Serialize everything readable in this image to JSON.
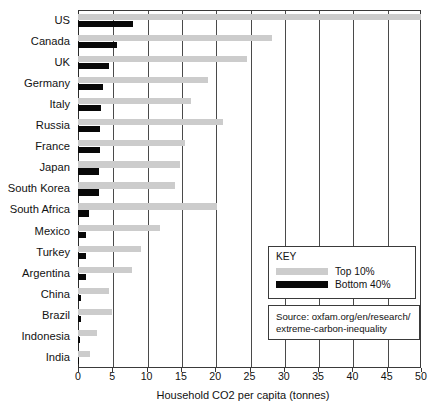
{
  "chart_data": {
    "type": "bar",
    "orientation": "horizontal",
    "title": "",
    "xlabel": "Household CO2 per capita (tonnes)",
    "ylabel": "",
    "xlim": [
      0,
      50
    ],
    "xticks": [
      0,
      5,
      10,
      15,
      20,
      25,
      30,
      35,
      40,
      45,
      50
    ],
    "grid": "vertical",
    "categories": [
      "US",
      "Canada",
      "UK",
      "Germany",
      "Italy",
      "Russia",
      "France",
      "Japan",
      "South Korea",
      "South Africa",
      "Mexico",
      "Turkey",
      "Argentina",
      "China",
      "Brazil",
      "Indonesia",
      "India"
    ],
    "series": [
      {
        "name": "Top 10%",
        "color": "#cccccc",
        "values": [
          50.0,
          28.3,
          24.6,
          19.0,
          16.4,
          21.2,
          15.6,
          14.9,
          14.2,
          20.2,
          12.0,
          9.2,
          7.8,
          4.5,
          5.0,
          2.8,
          1.8
        ]
      },
      {
        "name": "Bottom 40%",
        "color": "#080808",
        "values": [
          8.0,
          5.7,
          4.5,
          3.6,
          3.4,
          3.2,
          3.2,
          3.1,
          3.0,
          1.6,
          1.2,
          1.2,
          1.1,
          0.5,
          0.4,
          0.3,
          0.2
        ]
      }
    ],
    "legend": {
      "title": "KEY",
      "position": "inside-right",
      "entries": [
        {
          "label": "Top 10%",
          "color": "#cccccc"
        },
        {
          "label": "Bottom 40%",
          "color": "#080808"
        }
      ]
    },
    "annotations": {
      "source": {
        "line1": "Source: oxfam.org/en/research/",
        "line2": "extreme-carbon-inequality"
      }
    }
  }
}
